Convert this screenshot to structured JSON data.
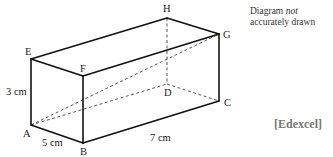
{
  "diagram": {
    "type": "cuboid",
    "vertices": {
      "A": {
        "label": "A",
        "x": 31,
        "y": 125
      },
      "B": {
        "label": "B",
        "x": 83,
        "y": 143
      },
      "C": {
        "label": "C",
        "x": 219,
        "y": 101
      },
      "D": {
        "label": "D",
        "x": 167,
        "y": 84
      },
      "E": {
        "label": "E",
        "x": 31,
        "y": 59
      },
      "F": {
        "label": "F",
        "x": 83,
        "y": 76
      },
      "G": {
        "label": "G",
        "x": 219,
        "y": 34
      },
      "H": {
        "label": "H",
        "x": 167,
        "y": 18
      }
    },
    "solid_edges": [
      "AB",
      "BC",
      "CG",
      "GH",
      "HE",
      "EA",
      "EF",
      "FG",
      "FB"
    ],
    "dashed_edges": [
      "HD",
      "AD",
      "DC",
      "AG"
    ],
    "dimensions": {
      "height": "3 cm",
      "width": "5 cm",
      "length": "7 cm"
    }
  },
  "note": {
    "line1_prefix": "Diagram ",
    "line1_emphasis": "not",
    "line2": "accurately drawn"
  },
  "source": "[Edexcel]"
}
